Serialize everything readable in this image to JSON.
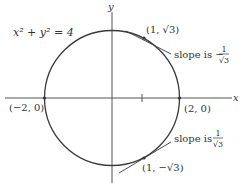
{
  "figure": {
    "equation": "x² + y² = 4",
    "x_axis_label": "x",
    "y_axis_label": "y",
    "points": [
      {
        "label": "(1, √3)",
        "x": 1,
        "y": 1.732
      },
      {
        "label": "(1, −√3)",
        "x": 1,
        "y": -1.732
      },
      {
        "label": "(−2, 0)",
        "x": -2,
        "y": 0
      },
      {
        "label": "(2, 0)",
        "x": 2,
        "y": 0
      }
    ],
    "annotations": {
      "top_slope_prefix": "slope is −",
      "top_slope_num": "1",
      "top_slope_den": "√3",
      "bottom_slope_prefix": "slope is ",
      "bottom_slope_num": "1",
      "bottom_slope_den": "√3"
    },
    "colors": {
      "curve": "#3a3a3a",
      "axis": "#555555",
      "text": "#333333"
    }
  }
}
